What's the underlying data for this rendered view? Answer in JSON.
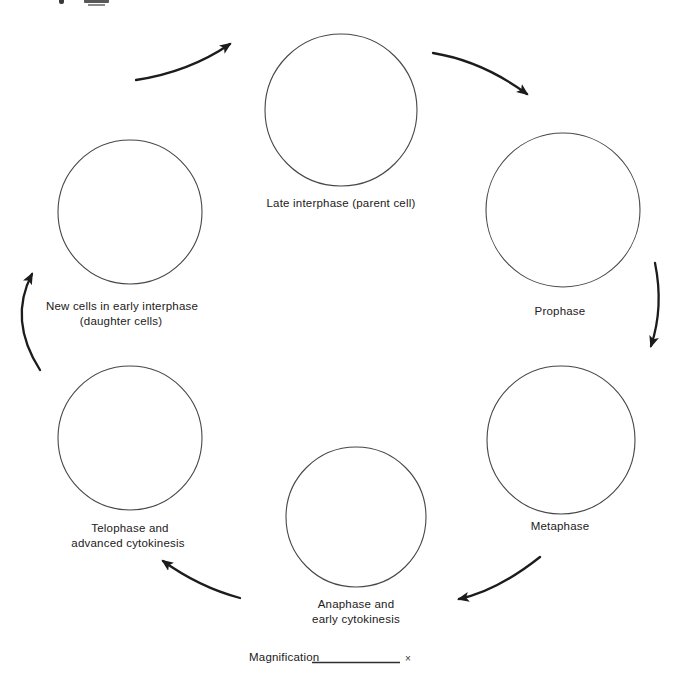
{
  "diagram": {
    "stages": {
      "late_interphase": {
        "label": "Late interphase (parent cell)"
      },
      "prophase": {
        "label": "Prophase"
      },
      "metaphase": {
        "label": "Metaphase"
      },
      "anaphase": {
        "label_line1": "Anaphase and",
        "label_line2": "early cytokinesis"
      },
      "telophase": {
        "label_line1": "Telophase and",
        "label_line2": "advanced cytokinesis"
      },
      "new_cells": {
        "label_line1": "New cells in early interphase",
        "label_line2": "(daughter cells)"
      }
    },
    "arrows": [
      {
        "from": "late_interphase",
        "to": "prophase"
      },
      {
        "from": "prophase",
        "to": "metaphase"
      },
      {
        "from": "metaphase",
        "to": "anaphase"
      },
      {
        "from": "anaphase",
        "to": "telophase"
      },
      {
        "from": "telophase",
        "to": "new_cells"
      },
      {
        "from": "new_cells",
        "to": "late_interphase"
      }
    ],
    "colors": {
      "background": "#ffffff",
      "ink": "#232020",
      "circle_stroke": "#474747",
      "arrow_stroke": "#1c1c1c"
    }
  },
  "footer": {
    "magnification_label": "Magnification",
    "magnification_symbol": "×"
  }
}
